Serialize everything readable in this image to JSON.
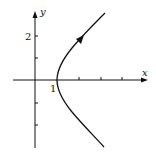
{
  "diagram": {
    "type": "parametric-curve",
    "curve": "right branch of hyperbola x^2 - y^2 = 1",
    "axes": {
      "x_label": "x",
      "y_label": "y",
      "x_tick_count": 4,
      "y_tick_count": 4
    },
    "tick_labels": {
      "x_one": "1",
      "y_two": "2"
    },
    "direction": "upward along upper branch (arrow)",
    "colors": {
      "stroke": "#111111",
      "background": "#ffffff"
    }
  }
}
